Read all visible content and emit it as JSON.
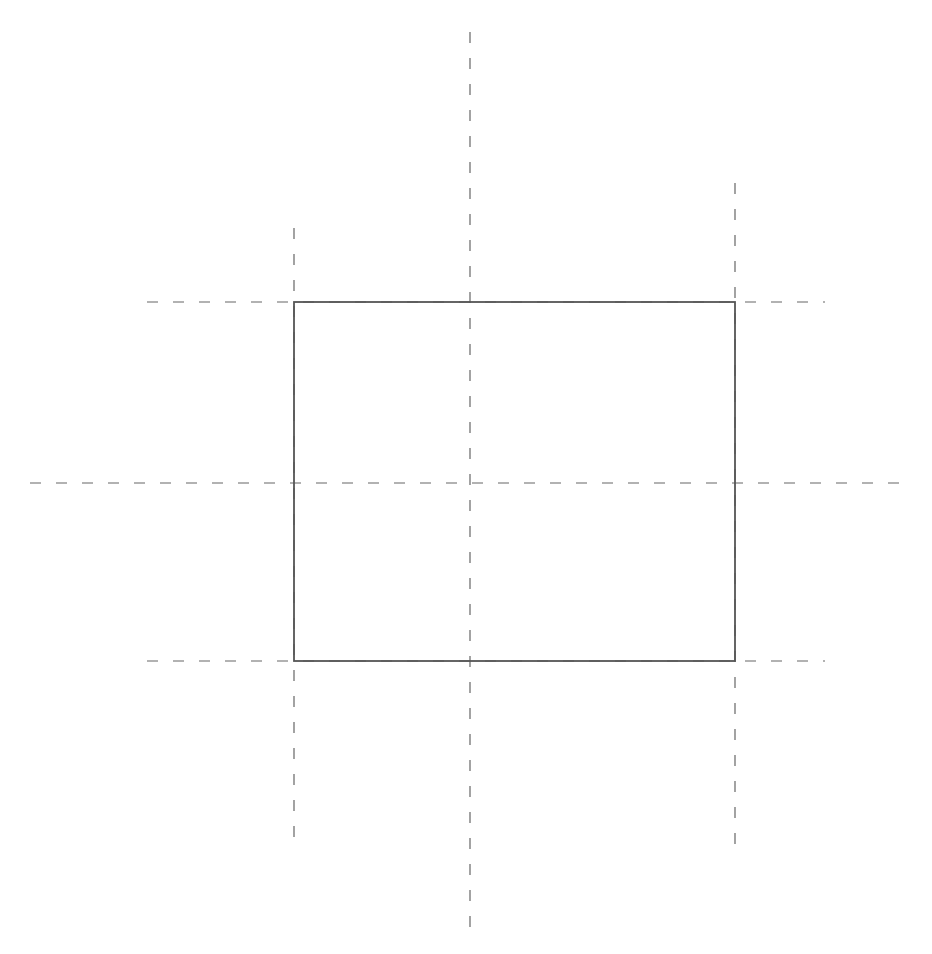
{
  "diagram": {
    "stroke_color": "#555555",
    "dash_color": "#666666",
    "rectangle": {
      "x1": 294,
      "y1": 302,
      "x2": 735,
      "y2": 661
    },
    "dashed_lines": [
      {
        "name": "vertical-left-guide",
        "x1": 294,
        "y1": 228,
        "x2": 294,
        "y2": 842
      },
      {
        "name": "vertical-center-guide",
        "x1": 470,
        "y1": 32,
        "x2": 470,
        "y2": 930
      },
      {
        "name": "vertical-right-guide",
        "x1": 735,
        "y1": 183,
        "x2": 735,
        "y2": 855
      },
      {
        "name": "horizontal-top-guide",
        "x1": 147,
        "y1": 302,
        "x2": 825,
        "y2": 302
      },
      {
        "name": "horizontal-middle-guide",
        "x1": 30,
        "y1": 483,
        "x2": 910,
        "y2": 483
      },
      {
        "name": "horizontal-bottom-guide",
        "x1": 147,
        "y1": 661,
        "x2": 825,
        "y2": 661
      }
    ]
  }
}
